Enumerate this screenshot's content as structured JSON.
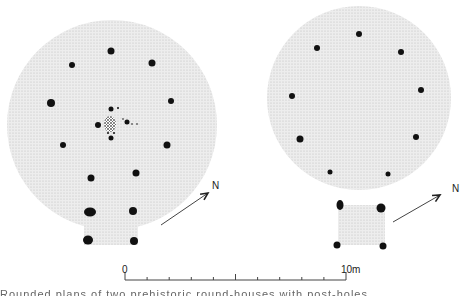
{
  "figure": {
    "type": "archaeological-plan",
    "structures": [
      {
        "name": "left-roundhouse",
        "circle": {
          "cx": 112,
          "cy": 125,
          "r": 105
        },
        "porch": {
          "x": 84,
          "y": 205,
          "w": 54,
          "h": 40
        },
        "postholes": [
          {
            "x": 111,
            "y": 51,
            "r": 3.5
          },
          {
            "x": 72,
            "y": 65,
            "r": 3
          },
          {
            "x": 152,
            "y": 63,
            "r": 3.5
          },
          {
            "x": 51,
            "y": 103,
            "r": 4
          },
          {
            "x": 171,
            "y": 101,
            "r": 3
          },
          {
            "x": 63,
            "y": 145,
            "r": 3
          },
          {
            "x": 167,
            "y": 145,
            "r": 3.5
          },
          {
            "x": 91,
            "y": 178,
            "r": 3.5
          },
          {
            "x": 136,
            "y": 173,
            "r": 3.5
          },
          {
            "x": 98,
            "y": 125,
            "r": 3
          },
          {
            "x": 111,
            "y": 109,
            "r": 2.5
          },
          {
            "x": 127,
            "y": 122,
            "r": 2.5
          },
          {
            "x": 111,
            "y": 138,
            "r": 2.5
          }
        ],
        "porch_postholes": [
          {
            "x": 90,
            "y": 212,
            "rx": 6,
            "ry": 4.5
          },
          {
            "x": 133,
            "y": 211,
            "rx": 4,
            "ry": 4
          },
          {
            "x": 88,
            "y": 240,
            "rx": 5,
            "ry": 4.5
          },
          {
            "x": 134,
            "y": 241,
            "rx": 4,
            "ry": 4
          }
        ],
        "hearth": {
          "cx": 110,
          "cy": 124,
          "rx": 6,
          "ry": 8
        },
        "small_marks": [
          {
            "x": 118,
            "y": 108,
            "r": 1
          },
          {
            "x": 123,
            "y": 119,
            "r": 0.8
          },
          {
            "x": 132,
            "y": 124,
            "r": 0.8
          },
          {
            "x": 137,
            "y": 124,
            "r": 0.8
          },
          {
            "x": 108,
            "y": 133,
            "r": 1
          },
          {
            "x": 114,
            "y": 133,
            "r": 1
          }
        ]
      },
      {
        "name": "right-roundhouse",
        "circle": {
          "cx": 359,
          "cy": 98,
          "r": 92
        },
        "porch": {
          "x": 338,
          "y": 205,
          "w": 47,
          "h": 40
        },
        "postholes": [
          {
            "x": 359,
            "y": 34,
            "r": 3
          },
          {
            "x": 317,
            "y": 48,
            "r": 3
          },
          {
            "x": 401,
            "y": 52,
            "r": 3
          },
          {
            "x": 292,
            "y": 96,
            "r": 3
          },
          {
            "x": 421,
            "y": 90,
            "r": 3
          },
          {
            "x": 300,
            "y": 139,
            "r": 3.5
          },
          {
            "x": 416,
            "y": 137,
            "r": 3
          },
          {
            "x": 330,
            "y": 172,
            "r": 2.5
          },
          {
            "x": 388,
            "y": 174,
            "r": 2.5
          }
        ],
        "porch_postholes": [
          {
            "x": 340,
            "y": 205,
            "rx": 3.5,
            "ry": 5
          },
          {
            "x": 381,
            "y": 208,
            "rx": 4.5,
            "ry": 4.5
          },
          {
            "x": 337,
            "y": 245,
            "rx": 3.5,
            "ry": 3.5
          },
          {
            "x": 383,
            "y": 246,
            "rx": 3.5,
            "ry": 3.5
          }
        ]
      }
    ],
    "north_arrows": [
      {
        "x1": 161,
        "y1": 225,
        "x2": 208,
        "y2": 193,
        "label": "N",
        "lx": 212,
        "ly": 180
      },
      {
        "x1": 393,
        "y1": 222,
        "x2": 440,
        "y2": 195,
        "label": "N",
        "lx": 452,
        "ly": 183
      }
    ],
    "scale_bar": {
      "x_start": 125,
      "x_end": 346,
      "y": 280,
      "start_label": "0",
      "end_label": "10m",
      "divisions": 10,
      "unit": "m"
    },
    "caption_fragment": "Rounded plans of two prehistoric round-houses with post-holes"
  },
  "colors": {
    "fill": "#e6e6e6",
    "dot": "#111111",
    "line": "#444444"
  }
}
